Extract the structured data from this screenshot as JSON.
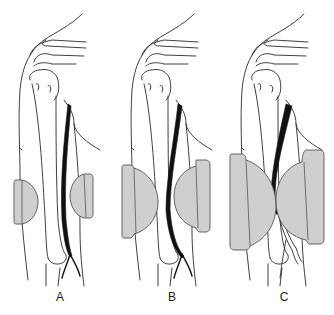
{
  "figure": {
    "colors": {
      "background": "#ffffff",
      "outline": "#2a2a2a",
      "nerve": "#111111",
      "pad_fill": "#cfcfcf",
      "pad_stroke": "#555555"
    },
    "panels": [
      {
        "label": "A",
        "pad_size": "small"
      },
      {
        "label": "B",
        "pad_size": "medium"
      },
      {
        "label": "C",
        "pad_size": "large"
      }
    ]
  }
}
